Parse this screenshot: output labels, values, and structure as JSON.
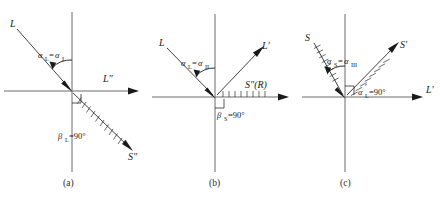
{
  "figure": {
    "type": "diagram",
    "background_color": "#ffffff",
    "line_color": "#4a4a4a",
    "ray_color": "#2b2b2b",
    "text_color": "#1a1a1a"
  },
  "panels": [
    {
      "id": "a",
      "caption": "(a)",
      "rays": [
        {
          "name": "incident-L",
          "label": "L",
          "label_full": "L",
          "direction": "upper-left-to-origin",
          "hatched": false
        },
        {
          "name": "axis-L-double-prime",
          "label": "L″",
          "base": "L",
          "prime": "″",
          "direction": "horizontal-right",
          "hatched": false
        },
        {
          "name": "ray-S-double-prime",
          "label": "S″",
          "base": "S",
          "prime": "″",
          "direction": "lower-right",
          "hatched": true
        }
      ],
      "angle_labels": [
        {
          "name": "alpha-L-equals-alpha-I",
          "text": "αL=αI",
          "base": "α",
          "sub1": "L",
          "eq": "=",
          "base2": "α",
          "sub2": "I"
        },
        {
          "name": "beta-L-equals-90",
          "text": "βL=90°",
          "base": "β",
          "sub1": "L",
          "value": "=90°"
        }
      ],
      "right_angle_marker": true
    },
    {
      "id": "b",
      "caption": "(b)",
      "rays": [
        {
          "name": "incident-L",
          "label": "L",
          "label_full": "L",
          "direction": "upper-left-to-origin",
          "hatched": false
        },
        {
          "name": "ray-L-prime",
          "label": "L′",
          "base": "L",
          "prime": "′",
          "direction": "upper-right",
          "hatched": false
        },
        {
          "name": "ray-S-double-prime-R",
          "label": "S″(R)",
          "base": "S",
          "prime": "″",
          "paren": "(R)",
          "direction": "horizontal-right",
          "hatched": true
        }
      ],
      "angle_labels": [
        {
          "name": "alpha-L-equals-alpha-II",
          "text": "αL=αII",
          "base": "α",
          "sub1": "L",
          "eq": "=",
          "base2": "α",
          "sub2": "II"
        },
        {
          "name": "beta-S-equals-90",
          "text": "βS=90°",
          "base": "β",
          "sub1": "S",
          "value": "=90°"
        }
      ],
      "right_angle_marker": true
    },
    {
      "id": "c",
      "caption": "(c)",
      "rays": [
        {
          "name": "incident-S",
          "label": "S",
          "label_full": "S",
          "direction": "upper-left-to-origin",
          "hatched": true
        },
        {
          "name": "ray-S-prime",
          "label": "S′",
          "base": "S",
          "prime": "′",
          "direction": "upper-right",
          "hatched": true
        },
        {
          "name": "axis-L-prime",
          "label": "L′",
          "base": "L",
          "prime": "′",
          "direction": "horizontal-right",
          "hatched": false
        }
      ],
      "angle_labels": [
        {
          "name": "alpha-S-equals-alpha-III",
          "text": "αS=αIII",
          "base": "α",
          "sub1": "S",
          "eq": "=",
          "base2": "α",
          "sub2": "III"
        },
        {
          "name": "alpha-L-prime-equals-90",
          "text": "αL′=90°",
          "base": "α",
          "sub1": "L",
          "prime": "′",
          "value": "=90°"
        }
      ],
      "right_angle_marker": true
    }
  ]
}
